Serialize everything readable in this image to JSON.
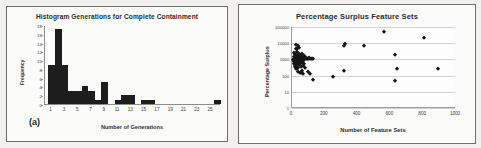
{
  "figure": {
    "panels": [
      {
        "caption": "(a)",
        "title": "Histogram Generations for Complete Containment"
      },
      {
        "caption": "(b)",
        "title": "Percentage Surplus Feature Sets"
      }
    ]
  },
  "chart_data": [
    {
      "type": "bar",
      "title": "Histogram Generations for Complete Containment",
      "xlabel": "Number of Generations",
      "ylabel": "Frequency",
      "xlim": [
        0,
        26.5
      ],
      "ylim": [
        0,
        18
      ],
      "xticks": [
        1,
        3,
        5,
        7,
        9,
        11,
        13,
        15,
        17,
        19,
        21,
        23,
        25
      ],
      "yticks": [
        0,
        2,
        4,
        6,
        8,
        10,
        12,
        14,
        16,
        18
      ],
      "grid": false,
      "categories": [
        1,
        2,
        3,
        4,
        5,
        6,
        7,
        8,
        9,
        10,
        11,
        12,
        13,
        14,
        15,
        16,
        17,
        18,
        19,
        20,
        21,
        22,
        23,
        24,
        25,
        26
      ],
      "values": [
        9,
        17,
        9,
        3,
        3,
        4,
        3,
        1,
        5,
        0,
        1,
        2,
        2,
        0,
        1,
        1,
        0,
        0,
        0,
        0,
        0,
        0,
        0,
        0,
        0,
        1
      ]
    },
    {
      "type": "scatter",
      "title": "Percentage Surplus Feature Sets",
      "xlabel": "Number of Feature Sets",
      "ylabel": "Percentage Surplus",
      "xlim": [
        0,
        1000
      ],
      "ylim": [
        1,
        100000
      ],
      "yscale": "log",
      "xticks": [
        0,
        200,
        400,
        600,
        800,
        1000
      ],
      "yticks": [
        1,
        10,
        100,
        1000,
        10000,
        100000
      ],
      "grid": true,
      "points": [
        [
          8,
          900
        ],
        [
          10,
          1400
        ],
        [
          12,
          520
        ],
        [
          14,
          2600
        ],
        [
          15,
          700
        ],
        [
          16,
          1100
        ],
        [
          18,
          330
        ],
        [
          19,
          1800
        ],
        [
          20,
          800
        ],
        [
          21,
          480
        ],
        [
          22,
          4200
        ],
        [
          23,
          1200
        ],
        [
          24,
          260
        ],
        [
          25,
          640
        ],
        [
          26,
          2000
        ],
        [
          28,
          900
        ],
        [
          29,
          380
        ],
        [
          30,
          1500
        ],
        [
          31,
          700
        ],
        [
          32,
          240
        ],
        [
          33,
          3000
        ],
        [
          34,
          1000
        ],
        [
          35,
          560
        ],
        [
          36,
          1700
        ],
        [
          37,
          820
        ],
        [
          38,
          300
        ],
        [
          40,
          1300
        ],
        [
          41,
          600
        ],
        [
          42,
          2300
        ],
        [
          43,
          950
        ],
        [
          44,
          430
        ],
        [
          46,
          1100
        ],
        [
          47,
          700
        ],
        [
          48,
          1900
        ],
        [
          50,
          520
        ],
        [
          52,
          1400
        ],
        [
          54,
          860
        ],
        [
          56,
          330
        ],
        [
          58,
          1150
        ],
        [
          60,
          640
        ],
        [
          62,
          2100
        ],
        [
          64,
          880
        ],
        [
          66,
          400
        ],
        [
          68,
          1250
        ],
        [
          70,
          760
        ],
        [
          72,
          1600
        ],
        [
          74,
          540
        ],
        [
          76,
          980
        ],
        [
          78,
          300
        ],
        [
          80,
          1350
        ],
        [
          35,
          6500
        ],
        [
          44,
          5200
        ],
        [
          22,
          8000
        ],
        [
          30,
          4600
        ],
        [
          55,
          150
        ],
        [
          62,
          180
        ],
        [
          70,
          120
        ],
        [
          48,
          140
        ],
        [
          38,
          165
        ],
        [
          85,
          1000
        ],
        [
          90,
          1100
        ],
        [
          95,
          1050
        ],
        [
          100,
          1000
        ],
        [
          105,
          1150
        ],
        [
          110,
          1000
        ],
        [
          115,
          1100
        ],
        [
          120,
          1050
        ],
        [
          125,
          1000
        ],
        [
          100,
          160
        ],
        [
          112,
          130
        ],
        [
          128,
          55
        ],
        [
          250,
          80
        ],
        [
          320,
          200
        ],
        [
          318,
          7000
        ],
        [
          325,
          8500
        ],
        [
          440,
          7000
        ],
        [
          560,
          50000
        ],
        [
          630,
          1800
        ],
        [
          640,
          250
        ],
        [
          630,
          45
        ],
        [
          805,
          20000
        ],
        [
          890,
          270
        ]
      ]
    }
  ]
}
